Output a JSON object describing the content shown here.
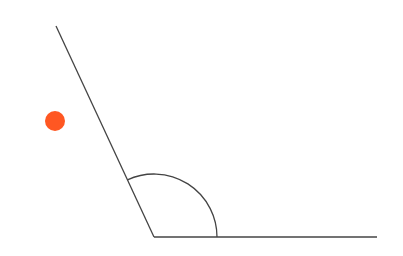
{
  "diagram": {
    "type": "angle",
    "vertex": {
      "x": 154,
      "y": 237
    },
    "ray_1_end": {
      "x": 56,
      "y": 26
    },
    "ray_2_end": {
      "x": 377,
      "y": 237
    },
    "arc_radius": 63,
    "line_color": "#444444",
    "marker": {
      "x": 55,
      "y": 121,
      "r": 10,
      "color": "#FF5722"
    }
  }
}
